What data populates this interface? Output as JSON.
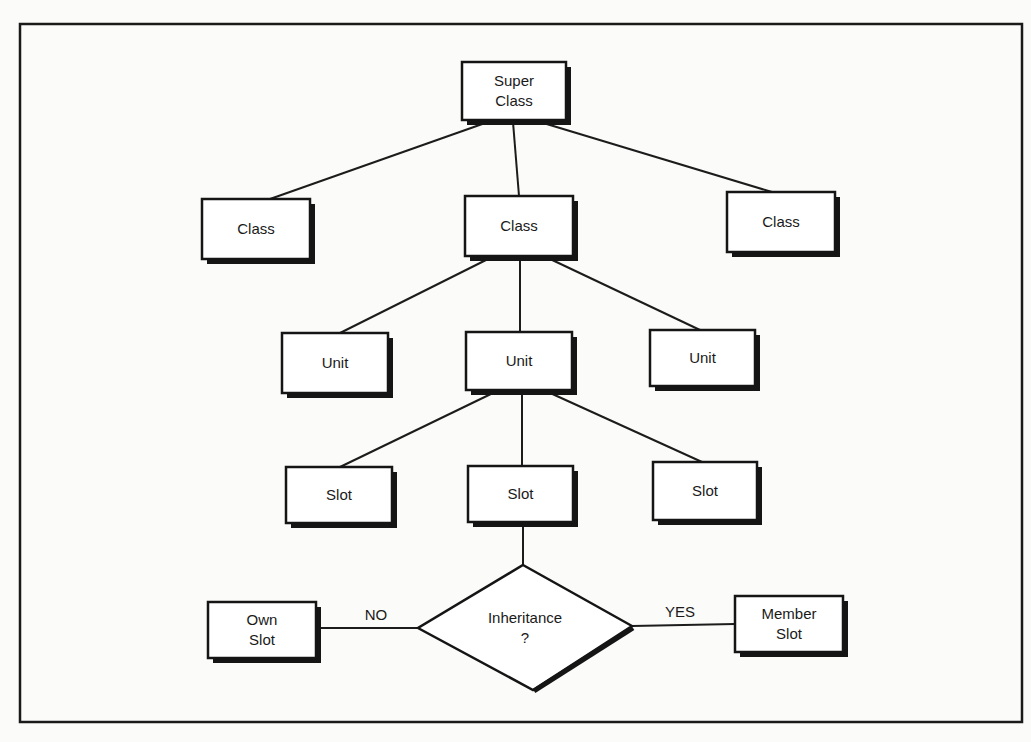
{
  "diagram": {
    "colors": {
      "ink": "#1a1a1a",
      "paper": "#fbfbf9",
      "box_fill": "#ffffff"
    },
    "frame": {
      "x": 20,
      "y": 24,
      "w": 1002,
      "h": 698
    },
    "nodes": [
      {
        "id": "super-class",
        "type": "box",
        "lines": [
          "Super",
          "Class"
        ],
        "x": 462,
        "y": 62,
        "w": 104,
        "h": 58
      },
      {
        "id": "class-left",
        "type": "box",
        "lines": [
          "Class"
        ],
        "x": 202,
        "y": 199,
        "w": 108,
        "h": 60
      },
      {
        "id": "class-middle",
        "type": "box",
        "lines": [
          "Class"
        ],
        "x": 465,
        "y": 196,
        "w": 108,
        "h": 60
      },
      {
        "id": "class-right",
        "type": "box",
        "lines": [
          "Class"
        ],
        "x": 727,
        "y": 192,
        "w": 108,
        "h": 60
      },
      {
        "id": "unit-left",
        "type": "box",
        "lines": [
          "Unit"
        ],
        "x": 282,
        "y": 333,
        "w": 106,
        "h": 60
      },
      {
        "id": "unit-middle",
        "type": "box",
        "lines": [
          "Unit"
        ],
        "x": 466,
        "y": 332,
        "w": 106,
        "h": 58
      },
      {
        "id": "unit-right",
        "type": "box",
        "lines": [
          "Unit"
        ],
        "x": 650,
        "y": 330,
        "w": 105,
        "h": 56
      },
      {
        "id": "slot-left",
        "type": "box",
        "lines": [
          "Slot"
        ],
        "x": 286,
        "y": 467,
        "w": 106,
        "h": 56
      },
      {
        "id": "slot-middle",
        "type": "box",
        "lines": [
          "Slot"
        ],
        "x": 468,
        "y": 466,
        "w": 105,
        "h": 56
      },
      {
        "id": "slot-right",
        "type": "box",
        "lines": [
          "Slot"
        ],
        "x": 653,
        "y": 462,
        "w": 104,
        "h": 58
      },
      {
        "id": "own-slot",
        "type": "box",
        "lines": [
          "Own",
          "Slot"
        ],
        "x": 208,
        "y": 602,
        "w": 108,
        "h": 56
      },
      {
        "id": "member-slot",
        "type": "box",
        "lines": [
          "Member",
          "Slot"
        ],
        "x": 735,
        "y": 596,
        "w": 108,
        "h": 56
      },
      {
        "id": "inheritance-decision",
        "type": "diamond",
        "lines": [
          "Inheritance",
          "?"
        ],
        "top": [
          523,
          565
        ],
        "left": [
          418,
          628
        ],
        "right": [
          632,
          626
        ],
        "bottom": [
          533,
          690
        ]
      }
    ],
    "edges": [
      {
        "from": "super-class",
        "to": "class-left",
        "x1": 488,
        "y1": 122,
        "x2": 270,
        "y2": 199
      },
      {
        "from": "super-class",
        "to": "class-middle",
        "x1": 513,
        "y1": 122,
        "x2": 519,
        "y2": 196
      },
      {
        "from": "super-class",
        "to": "class-right",
        "x1": 540,
        "y1": 122,
        "x2": 772,
        "y2": 192
      },
      {
        "from": "class-middle",
        "to": "unit-left",
        "x1": 490,
        "y1": 258,
        "x2": 340,
        "y2": 333
      },
      {
        "from": "class-middle",
        "to": "unit-middle",
        "x1": 520,
        "y1": 258,
        "x2": 520,
        "y2": 332
      },
      {
        "from": "class-middle",
        "to": "unit-right",
        "x1": 548,
        "y1": 258,
        "x2": 700,
        "y2": 330
      },
      {
        "from": "unit-middle",
        "to": "slot-left",
        "x1": 495,
        "y1": 392,
        "x2": 340,
        "y2": 467
      },
      {
        "from": "unit-middle",
        "to": "slot-middle",
        "x1": 522,
        "y1": 392,
        "x2": 522,
        "y2": 466
      },
      {
        "from": "unit-middle",
        "to": "slot-right",
        "x1": 548,
        "y1": 392,
        "x2": 702,
        "y2": 462
      },
      {
        "from": "slot-middle",
        "to": "inheritance-decision",
        "x1": 523,
        "y1": 522,
        "x2": 523,
        "y2": 565
      },
      {
        "from": "inheritance-decision",
        "to": "own-slot",
        "label": "NO",
        "x1": 418,
        "y1": 628,
        "x2": 318,
        "y2": 628,
        "lx": 376,
        "ly": 620
      },
      {
        "from": "inheritance-decision",
        "to": "member-slot",
        "label": "YES",
        "x1": 632,
        "y1": 626,
        "x2": 735,
        "y2": 624,
        "lx": 680,
        "ly": 617
      }
    ],
    "edge_labels": {
      "no": "NO",
      "yes": "YES"
    }
  }
}
